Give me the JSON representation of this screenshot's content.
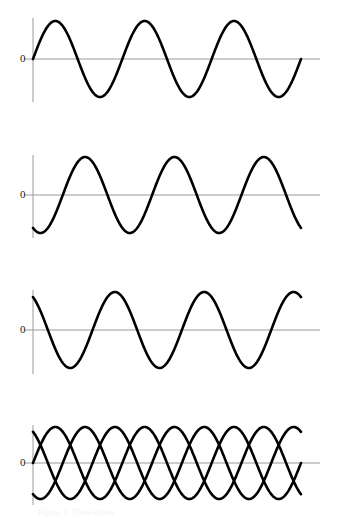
{
  "figure": {
    "title": "",
    "width": 337,
    "height": 524,
    "background": "#ffffff",
    "curve_color": "#000000",
    "axis_color": "#9a9a9a",
    "zero_line_color": "#9a9a9a",
    "label_color": "#1a1a1a",
    "caption": "Figure 1: Three-phase"
  },
  "axis_labels": {
    "zero": "0"
  },
  "panels": [
    {
      "name": "panel-phase-a",
      "zero_label": "0",
      "top": 10,
      "height": 115,
      "axis_x": 33,
      "axis_y_top": 18,
      "axis_y_bottom": 102,
      "zero_y": 59,
      "zero_line_x_end": 320,
      "plot_x_start": 33,
      "plot_x_end": 301,
      "label_x": 20,
      "label_y": 53
    },
    {
      "name": "panel-phase-b",
      "zero_label": "0",
      "top": 146,
      "height": 115,
      "axis_x": 33,
      "axis_y_top": 155,
      "axis_y_bottom": 238,
      "zero_y": 195,
      "zero_line_x_end": 320,
      "plot_x_start": 33,
      "plot_x_end": 301,
      "label_x": 20,
      "label_y": 189
    },
    {
      "name": "panel-phase-c",
      "zero_label": "0",
      "top": 282,
      "height": 115,
      "axis_x": 33,
      "axis_y_top": 290,
      "axis_y_bottom": 374,
      "zero_y": 330,
      "zero_line_x_end": 320,
      "plot_x_start": 33,
      "plot_x_end": 301,
      "label_x": 20,
      "label_y": 324
    },
    {
      "name": "panel-combined",
      "zero_label": "0",
      "top": 417,
      "height": 100,
      "axis_x": 33,
      "axis_y_top": 425,
      "axis_y_bottom": 505,
      "zero_y": 463,
      "zero_line_x_end": 320,
      "plot_x_start": 33,
      "plot_x_end": 301,
      "label_x": 20,
      "label_y": 457
    }
  ],
  "chart_data": {
    "type": "line",
    "xlabel": "",
    "ylabel": "",
    "grid": false,
    "legend": "none",
    "xlim": [
      0,
      3
    ],
    "ylim": [
      -1.15,
      1.15
    ],
    "x_unit": "cycles",
    "cycles_shown": 3,
    "amplitude": 1,
    "yticks": [
      0
    ],
    "ytick_labels": [
      "0"
    ],
    "xticks": [],
    "xtick_labels": [],
    "series": [
      {
        "name": "Phase A",
        "panel": 0,
        "phase_degrees": 0,
        "formula": "sin(2*pi*x)",
        "amplitude": 1,
        "values_at_quarter_cycles": [
          0,
          1,
          0,
          -1,
          0,
          1,
          0,
          -1,
          0,
          1,
          0,
          -1,
          0
        ]
      },
      {
        "name": "Phase B",
        "panel": 1,
        "phase_degrees": -120,
        "formula": "sin(2*pi*x - 2*pi/3)",
        "amplitude": 1,
        "values_at_quarter_cycles": [
          -0.866,
          0.5,
          0.866,
          -0.5,
          -0.866,
          0.5,
          0.866,
          -0.5,
          -0.866,
          0.5,
          0.866,
          -0.5,
          -0.866
        ]
      },
      {
        "name": "Phase C",
        "panel": 2,
        "phase_degrees": 120,
        "formula": "sin(2*pi*x + 2*pi/3)",
        "amplitude": 1,
        "values_at_quarter_cycles": [
          0.866,
          -0.5,
          -0.866,
          0.5,
          0.866,
          -0.5,
          -0.866,
          0.5,
          0.866,
          -0.5,
          -0.866,
          0.5,
          0.866
        ]
      },
      {
        "name": "Phase A (combined)",
        "panel": 3,
        "phase_degrees": 0,
        "formula": "sin(2*pi*x)",
        "amplitude": 1
      },
      {
        "name": "Phase B (combined)",
        "panel": 3,
        "phase_degrees": -120,
        "formula": "sin(2*pi*x - 2*pi/3)",
        "amplitude": 1
      },
      {
        "name": "Phase C (combined)",
        "panel": 3,
        "phase_degrees": 120,
        "formula": "sin(2*pi*x + 2*pi/3)",
        "amplitude": 1
      }
    ]
  }
}
